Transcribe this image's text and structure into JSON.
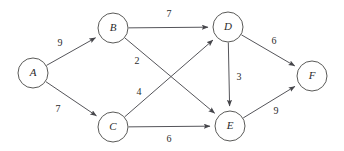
{
  "figure": {
    "background_color": "#ffffff",
    "node_stroke_color": "#5a5a58",
    "edge_stroke_color": "#55555a",
    "text_color": "#2b2b2b"
  },
  "chart_data": {
    "type": "diagram",
    "diagram_type": "directed-weighted-graph",
    "title": "",
    "xlabel": "",
    "ylabel": "",
    "grid": false,
    "legend": false,
    "nodes": [
      {
        "id": "A",
        "label": "A",
        "cx": 33,
        "cy": 73,
        "r": 15
      },
      {
        "id": "B",
        "label": "B",
        "cx": 113,
        "cy": 28,
        "r": 15
      },
      {
        "id": "C",
        "label": "C",
        "cx": 113,
        "cy": 127,
        "r": 15
      },
      {
        "id": "D",
        "label": "D",
        "cx": 228,
        "cy": 27,
        "r": 15
      },
      {
        "id": "E",
        "label": "E",
        "cx": 230,
        "cy": 126,
        "r": 15
      },
      {
        "id": "F",
        "label": "F",
        "cx": 312,
        "cy": 76,
        "r": 15
      }
    ],
    "edges": [
      {
        "from": "A",
        "to": "B",
        "weight": 9,
        "label": "9",
        "label_x": 60,
        "label_y": 44
      },
      {
        "from": "A",
        "to": "C",
        "weight": 7,
        "label": "7",
        "label_x": 58,
        "label_y": 110
      },
      {
        "from": "B",
        "to": "D",
        "weight": 7,
        "label": "7",
        "label_x": 169,
        "label_y": 15
      },
      {
        "from": "B",
        "to": "E",
        "weight": 2,
        "label": "2",
        "label_x": 137,
        "label_y": 62
      },
      {
        "from": "C",
        "to": "D",
        "weight": 4,
        "label": "4",
        "label_x": 139,
        "label_y": 93
      },
      {
        "from": "C",
        "to": "E",
        "weight": 6,
        "label": "6",
        "label_x": 169,
        "label_y": 140
      },
      {
        "from": "D",
        "to": "E",
        "weight": 3,
        "label": "3",
        "label_x": 239,
        "label_y": 78
      },
      {
        "from": "D",
        "to": "F",
        "weight": 6,
        "label": "6",
        "label_x": 274,
        "label_y": 42
      },
      {
        "from": "E",
        "to": "F",
        "weight": 9,
        "label": "9",
        "label_x": 276,
        "label_y": 112
      }
    ]
  }
}
